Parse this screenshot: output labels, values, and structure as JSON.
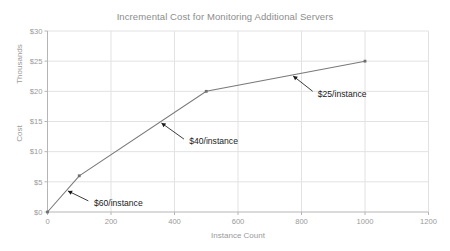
{
  "chart_data": {
    "type": "line",
    "title": "Incremental Cost for Monitoring Additional Servers",
    "xlabel": "Instance Count",
    "ylabel": "Cost",
    "y_unit_label": "Thousands",
    "x": [
      0,
      100,
      500,
      1000
    ],
    "values": [
      0,
      6,
      20,
      25
    ],
    "series": [
      {
        "name": "Cost",
        "x": [
          0,
          100,
          500,
          1000
        ],
        "values": [
          0,
          6,
          20,
          25
        ]
      }
    ],
    "xlim": [
      0,
      1200
    ],
    "ylim": [
      0,
      30
    ],
    "xticks": [
      0,
      200,
      400,
      600,
      800,
      1000,
      1200
    ],
    "xticklabels": [
      "0",
      "200",
      "400",
      "600",
      "800",
      "1000",
      "1200"
    ],
    "yticks": [
      0,
      5,
      10,
      15,
      20,
      25,
      30
    ],
    "yticklabels": [
      "$0",
      "$5",
      "$10",
      "$15",
      "$20",
      "$25",
      "$30"
    ],
    "grid": true,
    "legend": "none",
    "line_color": "#7a7a7a",
    "marker_color": "#6e6e6e",
    "grid_color": "#e2e2e2",
    "axis_color": "#b5b5b5",
    "text_color": "#9a9a9a",
    "annotation_color": "#1a1a1a",
    "annotations": [
      {
        "label": "$60/instance",
        "target_x": 60,
        "target_y": 3.6,
        "text_x": 140,
        "text_y": 1.55
      },
      {
        "label": "$40/instance",
        "target_x": 355,
        "target_y": 14.9,
        "text_x": 440,
        "text_y": 11.7
      },
      {
        "label": "$25/instance",
        "target_x": 770,
        "target_y": 22.7,
        "text_x": 845,
        "text_y": 19.6
      }
    ]
  }
}
